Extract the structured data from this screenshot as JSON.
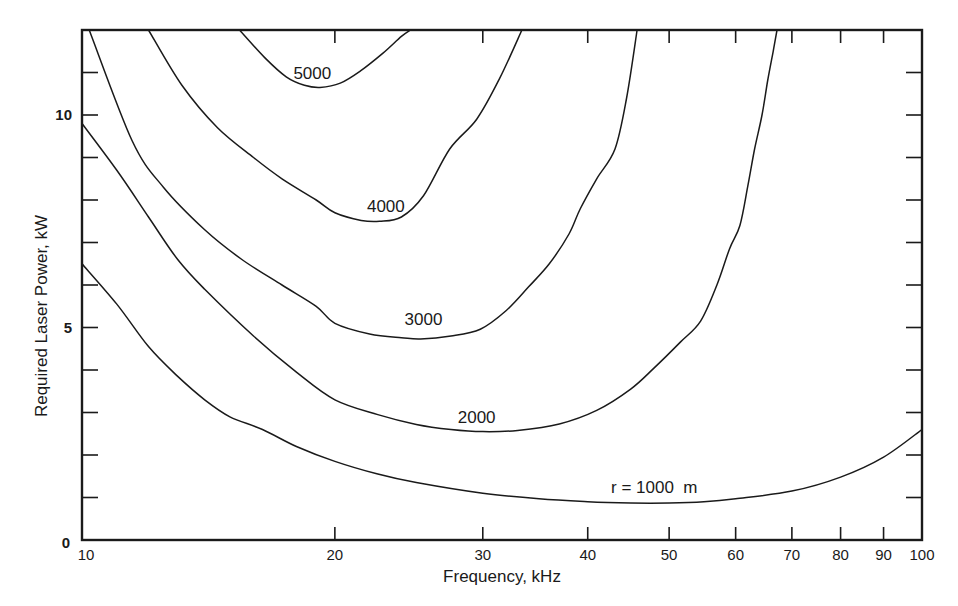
{
  "chart_data": {
    "type": "line",
    "title": "",
    "xlabel": "Frequency, kHz",
    "ylabel": "Required Laser Power, kW",
    "xscale": "log",
    "xlim": [
      10,
      100
    ],
    "ylim": [
      0,
      12
    ],
    "grid": false,
    "legend": "inline curve labels",
    "x_tick_labels": [
      "10",
      "20",
      "30",
      "40",
      "50",
      "60",
      "70",
      "80",
      "90",
      "100"
    ],
    "x_ticks": [
      10,
      20,
      30,
      40,
      50,
      60,
      70,
      80,
      90,
      100
    ],
    "y_tick_labels": [
      "0",
      "5",
      "10"
    ],
    "y_labeled_ticks": [
      0,
      5,
      10
    ],
    "y_minor_ticks": [
      1,
      2,
      3,
      4,
      6,
      7,
      8,
      9,
      11
    ],
    "series": [
      {
        "name": "r = 1000  m",
        "label": "r = 1000  m",
        "label_pos": [
          48,
          1.25
        ],
        "x": [
          10,
          11,
          12,
          13,
          14,
          15,
          16.4,
          18,
          20,
          22.5,
          25,
          30,
          35,
          40,
          45,
          50,
          55,
          60,
          70,
          80,
          90,
          100
        ],
        "y": [
          6.5,
          5.55,
          4.55,
          3.85,
          3.3,
          2.9,
          2.6,
          2.2,
          1.85,
          1.55,
          1.35,
          1.1,
          0.97,
          0.9,
          0.87,
          0.87,
          0.9,
          0.97,
          1.15,
          1.48,
          1.95,
          2.6
        ]
      },
      {
        "name": "2000",
        "label": "2000",
        "label_pos": [
          29.5,
          2.9
        ],
        "x": [
          10,
          11,
          12,
          13,
          14,
          16,
          18,
          20,
          22.5,
          25,
          27.5,
          30,
          33,
          37,
          41,
          45,
          48,
          51.6,
          54.5,
          57,
          59,
          60.7,
          62,
          63.2,
          64.5,
          65.5,
          66.5,
          67.2
        ],
        "y": [
          9.8,
          8.7,
          7.6,
          6.6,
          5.9,
          4.8,
          3.95,
          3.3,
          2.95,
          2.72,
          2.6,
          2.55,
          2.58,
          2.73,
          3.05,
          3.55,
          4.05,
          4.66,
          5.15,
          6.0,
          6.85,
          7.4,
          8.3,
          9.2,
          10.0,
          10.8,
          11.5,
          12.0
        ]
      },
      {
        "name": "3000",
        "label": "3000",
        "label_pos": [
          25.5,
          5.2
        ],
        "x": [
          10.2,
          11.47,
          12.5,
          14,
          15.5,
          17.3,
          19,
          20,
          22,
          24,
          25.3,
          27.5,
          29.8,
          32,
          34,
          36,
          38,
          39.2,
          41,
          43.1,
          44.5,
          45.8
        ],
        "y": [
          12.0,
          9.4,
          8.3,
          7.3,
          6.6,
          6.0,
          5.5,
          5.1,
          4.85,
          4.76,
          4.73,
          4.8,
          4.96,
          5.4,
          5.95,
          6.5,
          7.2,
          7.8,
          8.5,
          9.2,
          10.4,
          12.0
        ]
      },
      {
        "name": "4000",
        "label": "4000",
        "label_pos": [
          23.0,
          7.85
        ],
        "x": [
          12.0,
          13.15,
          14.5,
          16,
          17.3,
          19,
          20,
          21.5,
          22.6,
          24,
          25.5,
          27.4,
          29.5,
          31.4,
          33.4
        ],
        "y": [
          12.0,
          10.7,
          9.7,
          9.0,
          8.5,
          8.0,
          7.7,
          7.52,
          7.5,
          7.6,
          8.1,
          9.2,
          9.9,
          10.85,
          12.0
        ]
      },
      {
        "name": "5000",
        "label": "5000",
        "label_pos": [
          18.8,
          11.0
        ],
        "x": [
          15.4,
          16.5,
          17.5,
          18.4,
          19.2,
          20.3,
          21.5,
          22.8,
          24.0,
          24.6
        ],
        "y": [
          12.0,
          11.35,
          10.9,
          10.7,
          10.65,
          10.75,
          11.05,
          11.45,
          11.85,
          12.0
        ]
      }
    ]
  }
}
